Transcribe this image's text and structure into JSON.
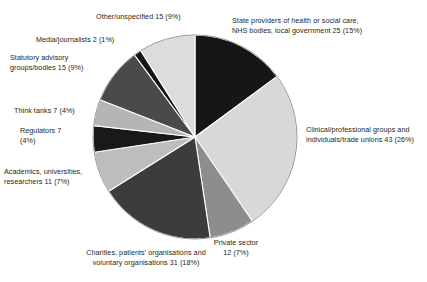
{
  "chart_data": {
    "type": "pie",
    "title": "",
    "subtitle": "",
    "xlabel": "",
    "ylabel": "",
    "legend_position": "none",
    "grid": false,
    "total": 168,
    "start_angle_deg": 0,
    "direction": "clockwise",
    "categories": [
      "State providers of health or social care, NHS bodies, local government",
      "Clinical/professional groups and individuals/trade unions",
      "Private sector",
      "Charities, patients' organisations and voluntary organisations",
      "Academics, universities, researchers",
      "Regulators",
      "Think tanks",
      "Statutory advisory groups/bodies",
      "Media/journalists",
      "Other/unspecified"
    ],
    "values": [
      25,
      43,
      12,
      31,
      11,
      7,
      7,
      15,
      2,
      15
    ],
    "percentages": [
      15,
      26,
      7,
      18,
      7,
      4,
      4,
      9,
      1,
      9
    ],
    "colors": [
      "#161616",
      "#d8d8d8",
      "#8d8d8d",
      "#3c3c3c",
      "#bdbdbd",
      "#191919",
      "#b5b5b5",
      "#4a4a4a",
      "#141414",
      "#dcdcdc"
    ],
    "slices": [
      {
        "id": "state-providers",
        "label_lines": "State providers of health or social care,\nNHS bodies, local government 25 (15%)",
        "name": "State providers of health or social care, NHS bodies, local government",
        "value": 25,
        "percent": 15,
        "color": "#161616"
      },
      {
        "id": "clinical-professional",
        "label_lines": "Clinical/professional groups and\nindividuals/trade unions 43 (26%)",
        "name": "Clinical/professional groups and individuals/trade unions",
        "value": 43,
        "percent": 26,
        "color": "#d8d8d8"
      },
      {
        "id": "private-sector",
        "label_lines": "Private sector\n12 (7%)",
        "name": "Private sector",
        "value": 12,
        "percent": 7,
        "color": "#8d8d8d"
      },
      {
        "id": "charities",
        "label_lines": "Charities, patients' organisations and\nvoluntary organisations 31 (18%)",
        "name": "Charities, patients' organisations and voluntary organisations",
        "value": 31,
        "percent": 18,
        "color": "#3c3c3c"
      },
      {
        "id": "academics",
        "label_lines": "Academics, universities,\nresearchers 11 (7%)",
        "name": "Academics, universities, researchers",
        "value": 11,
        "percent": 7,
        "color": "#bdbdbd"
      },
      {
        "id": "regulators",
        "label_lines": "Regulators 7\n(4%)",
        "name": "Regulators",
        "value": 7,
        "percent": 4,
        "color": "#191919"
      },
      {
        "id": "think-tanks",
        "label_lines": "Think tanks 7 (4%)",
        "name": "Think tanks",
        "value": 7,
        "percent": 4,
        "color": "#b5b5b5"
      },
      {
        "id": "statutory-advisory",
        "label_lines": "Statutory advisory\ngroups/bodies 15 (9%)",
        "name": "Statutory advisory groups/bodies",
        "value": 15,
        "percent": 9,
        "color": "#4a4a4a"
      },
      {
        "id": "media-journalists",
        "label_lines": "Media/journalists 2 (1%)",
        "name": "Media/journalists",
        "value": 2,
        "percent": 1,
        "color": "#141414"
      },
      {
        "id": "other-unspecified",
        "label_lines": "Other/unspecified 15 (9%)",
        "name": "Other/unspecified",
        "value": 15,
        "percent": 9,
        "color": "#dcdcdc"
      }
    ],
    "geometry": {
      "cx": 195,
      "cy": 137,
      "r": 102,
      "outline_color": "#9a9a9a",
      "background": "#ffffff"
    }
  }
}
